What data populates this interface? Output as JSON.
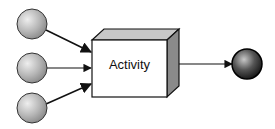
{
  "diagram": {
    "activity_label": "Activity",
    "inputs": [
      {
        "name": "input-1",
        "cx": 32,
        "cy": 24
      },
      {
        "name": "input-2",
        "cx": 32,
        "cy": 68
      },
      {
        "name": "input-3",
        "cx": 32,
        "cy": 108
      }
    ],
    "output": {
      "name": "output",
      "cx": 247,
      "cy": 64
    },
    "colors": {
      "input_circle": "#b8b8b8",
      "output_circle": "#444444",
      "box_front": "#ffffff",
      "box_top": "#c8c8c8",
      "box_side": "#8a8a8a",
      "stroke": "#111111"
    }
  }
}
